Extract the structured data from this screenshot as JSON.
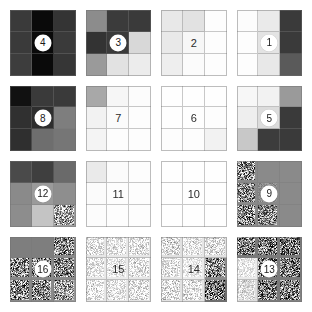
{
  "board": {
    "title": "Grayscale Tile Puzzle Board",
    "rows": 4,
    "columns": 4,
    "tile_grid_size": 3,
    "background_color": "#ffffff",
    "grid_line_color": "#787878",
    "badge_background": "#ffffff",
    "badge_text_color": "#1a1a1a",
    "tiles": [
      {
        "label": "4",
        "badge_style": "circle",
        "name": "tile-4",
        "cells": [
          "#3a3a3a",
          "#0a0a0a",
          "#343434",
          "#3a3a3a",
          "#0a0a0a",
          "#3a3a3a",
          "#3d3d3d",
          "#0a0a0a",
          "#363636"
        ],
        "noise": [
          0,
          0,
          0,
          0,
          0,
          0,
          0,
          0,
          0
        ]
      },
      {
        "label": "3",
        "badge_style": "circle",
        "name": "tile-3",
        "cells": [
          "#8c8c8c",
          "#3b3b3b",
          "#3a3a3a",
          "#333333",
          "#3a3a3a",
          "#d8d8d8",
          "#9a9a9a",
          "#e2e2e2",
          "#ececec"
        ],
        "noise": [
          0,
          0,
          0,
          0,
          0,
          0,
          0,
          0,
          0
        ]
      },
      {
        "label": "2",
        "badge_style": "plain",
        "name": "tile-2",
        "cells": [
          "#e8e8e8",
          "#e2e2e2",
          "#fdfdfd",
          "#e9e9e9",
          "#f7f7f7",
          "#fdfdfd",
          "#eeeeee",
          "#fbfbfb",
          "#fdfdfd"
        ],
        "noise": [
          0,
          0,
          0,
          0,
          0,
          0,
          0,
          0,
          0
        ]
      },
      {
        "label": "1",
        "badge_style": "circle",
        "name": "tile-1",
        "cells": [
          "#fcfcfc",
          "#eaeaea",
          "#3a3a3a",
          "#fdfdfd",
          "#e3e3e3",
          "#3a3a3a",
          "#fdfdfd",
          "#e8e8e8",
          "#5a5a5a"
        ],
        "noise": [
          0,
          0,
          0,
          0,
          0,
          0,
          0,
          0,
          0
        ]
      },
      {
        "label": "8",
        "badge_style": "circle",
        "name": "tile-8",
        "cells": [
          "#111111",
          "#3a3a3a",
          "#3a3a3a",
          "#303030",
          "#2e2e2e",
          "#7e7e7e",
          "#2f2f2f",
          "#6e6e6e",
          "#767676"
        ],
        "noise": [
          0,
          0,
          0,
          0,
          0,
          0,
          0,
          0,
          0
        ]
      },
      {
        "label": "7",
        "badge_style": "plain",
        "name": "tile-7",
        "cells": [
          "#a8a8a8",
          "#f6f6f6",
          "#fcfcfc",
          "#f2f2f2",
          "#fbfbfb",
          "#fdfdfd",
          "#f4f4f4",
          "#fdfdfd",
          "#fdfdfd"
        ],
        "noise": [
          0,
          0,
          0,
          0,
          0,
          0,
          0,
          0,
          0
        ]
      },
      {
        "label": "6",
        "badge_style": "plain",
        "name": "tile-6",
        "cells": [
          "#fefefe",
          "#fefefe",
          "#fefefe",
          "#fefefe",
          "#fefefe",
          "#fdfdfd",
          "#fdfdfd",
          "#fdfdfd",
          "#f2f2f2"
        ],
        "noise": [
          0,
          0,
          0,
          0,
          0,
          0,
          0,
          0,
          0
        ]
      },
      {
        "label": "5",
        "badge_style": "circle",
        "name": "tile-5",
        "cells": [
          "#f7f7f7",
          "#f2f2f2",
          "#9a9a9a",
          "#eeeeee",
          "#dcdcdc",
          "#3a3a3a",
          "#c8c8c8",
          "#3c3c3c",
          "#3a3a3a"
        ],
        "noise": [
          0,
          0,
          0,
          0,
          0,
          0,
          0,
          0,
          0
        ]
      },
      {
        "label": "12",
        "badge_style": "circle",
        "name": "tile-12",
        "cells": [
          "#4a4a4a",
          "#3f3f3f",
          "#6a6a6a",
          "#8a8a8a",
          "#9a9a9a",
          "#8e8e8e",
          "#8d8d8d",
          "#c4c4c4",
          "#a0a0a0"
        ],
        "noise": [
          0,
          0,
          0,
          0,
          0,
          0,
          0,
          0,
          0.85
        ]
      },
      {
        "label": "11",
        "badge_style": "plain",
        "name": "tile-11",
        "cells": [
          "#eaeaea",
          "#fbfbfb",
          "#fdfdfd",
          "#fbfbfb",
          "#fdfdfd",
          "#fdfdfd",
          "#fcfcfc",
          "#fdfdfd",
          "#fdfdfd"
        ],
        "noise": [
          0,
          0,
          0,
          0,
          0,
          0,
          0,
          0,
          0
        ]
      },
      {
        "label": "10",
        "badge_style": "plain",
        "name": "tile-10",
        "cells": [
          "#fefefe",
          "#fefefe",
          "#fefefe",
          "#fefefe",
          "#fefefe",
          "#fefefe",
          "#fefefe",
          "#fefefe",
          "#fefefe"
        ],
        "noise": [
          0,
          0,
          0,
          0,
          0,
          0,
          0,
          0,
          0
        ]
      },
      {
        "label": "9",
        "badge_style": "circle",
        "name": "tile-9",
        "cells": [
          "#8a8a8a",
          "#8a8a8a",
          "#8a8a8a",
          "#8a8a8a",
          "#8a8a8a",
          "#8a8a8a",
          "#8a8a8a",
          "#8a8a8a",
          "#8a8a8a"
        ],
        "noise": [
          0.95,
          0,
          0,
          0.9,
          0.2,
          0,
          0.95,
          0.85,
          0
        ]
      },
      {
        "label": "16",
        "badge_style": "circle",
        "name": "tile-16",
        "cells": [
          "#7e7e7e",
          "#7e7e7e",
          "#8a8a8a",
          "#8a8a8a",
          "#8a8a8a",
          "#8a8a8a",
          "#8a8a8a",
          "#8a8a8a",
          "#9a9a9a"
        ],
        "noise": [
          0,
          0,
          0.95,
          0.95,
          0.9,
          0.95,
          0.95,
          0.95,
          0.8
        ]
      },
      {
        "label": "15",
        "badge_style": "plain",
        "name": "tile-15",
        "cells": [
          "#e6e6e6",
          "#e8e8e8",
          "#e6e6e6",
          "#e8e8e8",
          "#eaeaea",
          "#e6e6e6",
          "#e6e6e6",
          "#e8e8e8",
          "#e4e4e4"
        ],
        "noise": [
          0.45,
          0.4,
          0.45,
          0.4,
          0.35,
          0.45,
          0.45,
          0.4,
          0.5
        ]
      },
      {
        "label": "14",
        "badge_style": "plain",
        "name": "tile-14",
        "cells": [
          "#e0e0e0",
          "#e6e6e6",
          "#e2e2e2",
          "#e6e6e6",
          "#ebebeb",
          "#8e8e8e",
          "#e2e2e2",
          "#e4e4e4",
          "#6e6e6e"
        ],
        "noise": [
          0.5,
          0.4,
          0.5,
          0.4,
          0.3,
          0.95,
          0.5,
          0.45,
          0.95
        ]
      },
      {
        "label": "13",
        "badge_style": "circle",
        "name": "tile-13",
        "cells": [
          "#7a7a7a",
          "#7a7a7a",
          "#7a7a7a",
          "#eaeaea",
          "#7a7a7a",
          "#7a7a7a",
          "#dcdcdc",
          "#7a7a7a",
          "#828282"
        ],
        "noise": [
          0.95,
          0.95,
          0.95,
          0.3,
          0.95,
          0.95,
          0.35,
          0.95,
          0.95
        ]
      }
    ]
  }
}
